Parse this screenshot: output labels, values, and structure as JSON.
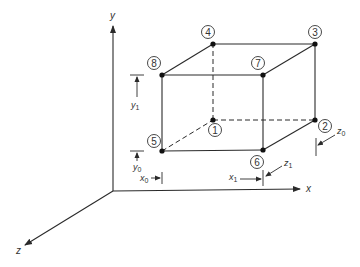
{
  "diagram": {
    "type": "3D box in coordinate system",
    "colors": {
      "line": "#2a2a2a",
      "background": "#ffffff"
    },
    "axes": {
      "x": {
        "label": "x"
      },
      "y": {
        "label": "y"
      },
      "z": {
        "label": "z"
      }
    },
    "nodes": [
      {
        "id": "1",
        "label": "1"
      },
      {
        "id": "2",
        "label": "2"
      },
      {
        "id": "3",
        "label": "3"
      },
      {
        "id": "4",
        "label": "4"
      },
      {
        "id": "5",
        "label": "5"
      },
      {
        "id": "6",
        "label": "6"
      },
      {
        "id": "7",
        "label": "7"
      },
      {
        "id": "8",
        "label": "8"
      }
    ],
    "dimensions": {
      "x0": {
        "base": "x",
        "sub": "0"
      },
      "x1": {
        "base": "x",
        "sub": "1"
      },
      "y0": {
        "base": "y",
        "sub": "0"
      },
      "y1": {
        "base": "y",
        "sub": "1"
      },
      "z0": {
        "base": "z",
        "sub": "0"
      },
      "z1": {
        "base": "z",
        "sub": "1"
      }
    },
    "edges": {
      "solid": [
        "5-6",
        "6-7",
        "7-8",
        "8-5",
        "8-4",
        "4-3",
        "3-7",
        "3-2",
        "2-6"
      ],
      "dashed": [
        "5-1",
        "1-2",
        "1-4"
      ]
    }
  }
}
